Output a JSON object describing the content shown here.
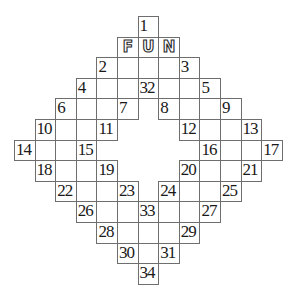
{
  "puzzle": {
    "title": "",
    "grid_size": {
      "rows": 13,
      "cols": 13
    },
    "cell_px": 20.6,
    "border_color": "#6e6e6e",
    "cells": [
      {
        "r": 0,
        "c": 6,
        "num": "1"
      },
      {
        "r": 1,
        "c": 5,
        "letter": "F"
      },
      {
        "r": 1,
        "c": 6,
        "letter": "U"
      },
      {
        "r": 1,
        "c": 7,
        "letter": "N"
      },
      {
        "r": 2,
        "c": 4,
        "num": "2"
      },
      {
        "r": 2,
        "c": 5
      },
      {
        "r": 2,
        "c": 6
      },
      {
        "r": 2,
        "c": 7
      },
      {
        "r": 2,
        "c": 8,
        "num": "3"
      },
      {
        "r": 3,
        "c": 3,
        "num": "4"
      },
      {
        "r": 3,
        "c": 4
      },
      {
        "r": 3,
        "c": 5
      },
      {
        "r": 3,
        "c": 6,
        "num": "32"
      },
      {
        "r": 3,
        "c": 7
      },
      {
        "r": 3,
        "c": 8
      },
      {
        "r": 3,
        "c": 9,
        "num": "5"
      },
      {
        "r": 4,
        "c": 2,
        "num": "6"
      },
      {
        "r": 4,
        "c": 3
      },
      {
        "r": 4,
        "c": 4
      },
      {
        "r": 4,
        "c": 5,
        "num": "7"
      },
      {
        "r": 4,
        "c": 7,
        "num": "8"
      },
      {
        "r": 4,
        "c": 8
      },
      {
        "r": 4,
        "c": 9
      },
      {
        "r": 4,
        "c": 10,
        "num": "9"
      },
      {
        "r": 5,
        "c": 1,
        "num": "10"
      },
      {
        "r": 5,
        "c": 2
      },
      {
        "r": 5,
        "c": 3
      },
      {
        "r": 5,
        "c": 4,
        "num": "11"
      },
      {
        "r": 5,
        "c": 8,
        "num": "12"
      },
      {
        "r": 5,
        "c": 9
      },
      {
        "r": 5,
        "c": 10
      },
      {
        "r": 5,
        "c": 11,
        "num": "13"
      },
      {
        "r": 6,
        "c": 0,
        "num": "14"
      },
      {
        "r": 6,
        "c": 1
      },
      {
        "r": 6,
        "c": 2
      },
      {
        "r": 6,
        "c": 3,
        "num": "15"
      },
      {
        "r": 6,
        "c": 9,
        "num": "16"
      },
      {
        "r": 6,
        "c": 10
      },
      {
        "r": 6,
        "c": 11
      },
      {
        "r": 6,
        "c": 12,
        "num": "17"
      },
      {
        "r": 7,
        "c": 1,
        "num": "18"
      },
      {
        "r": 7,
        "c": 2
      },
      {
        "r": 7,
        "c": 3
      },
      {
        "r": 7,
        "c": 4,
        "num": "19"
      },
      {
        "r": 7,
        "c": 8,
        "num": "20"
      },
      {
        "r": 7,
        "c": 9
      },
      {
        "r": 7,
        "c": 10
      },
      {
        "r": 7,
        "c": 11,
        "num": "21"
      },
      {
        "r": 8,
        "c": 2,
        "num": "22"
      },
      {
        "r": 8,
        "c": 3
      },
      {
        "r": 8,
        "c": 4
      },
      {
        "r": 8,
        "c": 5,
        "num": "23"
      },
      {
        "r": 8,
        "c": 7,
        "num": "24"
      },
      {
        "r": 8,
        "c": 8
      },
      {
        "r": 8,
        "c": 9
      },
      {
        "r": 8,
        "c": 10,
        "num": "25"
      },
      {
        "r": 9,
        "c": 3,
        "num": "26"
      },
      {
        "r": 9,
        "c": 4
      },
      {
        "r": 9,
        "c": 5
      },
      {
        "r": 9,
        "c": 6,
        "num": "33"
      },
      {
        "r": 9,
        "c": 7
      },
      {
        "r": 9,
        "c": 8
      },
      {
        "r": 9,
        "c": 9,
        "num": "27"
      },
      {
        "r": 10,
        "c": 4,
        "num": "28"
      },
      {
        "r": 10,
        "c": 5
      },
      {
        "r": 10,
        "c": 6
      },
      {
        "r": 10,
        "c": 7
      },
      {
        "r": 10,
        "c": 8,
        "num": "29"
      },
      {
        "r": 11,
        "c": 5,
        "num": "30"
      },
      {
        "r": 11,
        "c": 6
      },
      {
        "r": 11,
        "c": 7,
        "num": "31"
      },
      {
        "r": 12,
        "c": 6,
        "num": "34"
      }
    ]
  }
}
